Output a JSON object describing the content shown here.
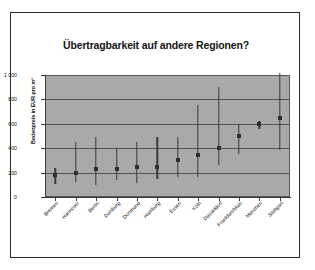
{
  "slide": {
    "title": "Übertragbarkeit auf andere Regionen?"
  },
  "chart_data": {
    "type": "scatter",
    "title": "Übertragbarkeit auf andere Regionen?",
    "xlabel": "",
    "ylabel": "Bodenpreis in EUR pro m²",
    "ylim": [
      0,
      1000
    ],
    "ytick_labels": [
      "1 000",
      "800",
      "600",
      "400",
      "200",
      "0"
    ],
    "ytick_values": [
      1000,
      800,
      600,
      400,
      200,
      0
    ],
    "grid": true,
    "gridline_values": [
      800,
      600,
      400,
      200
    ],
    "legend": "none",
    "plot_background": "#a9a9a9",
    "marker_color": "#2e2e2e",
    "categories": [
      "Bremen",
      "Hannover",
      "Berlin",
      "Duisburg",
      "Dortmund",
      "Hamburg",
      "Essen",
      "Köln",
      "Düsseldorf",
      "Frankfurt/Main",
      "München",
      "Stuttgart"
    ],
    "series": [
      {
        "name": "Bodenpreis (Median)",
        "values": [
          180,
          200,
          230,
          230,
          250,
          250,
          305,
          345,
          400,
          500,
          600,
          650
        ]
      },
      {
        "name": "Untergrenze",
        "values": [
          110,
          125,
          100,
          135,
          115,
          150,
          160,
          160,
          265,
          350,
          555,
          390
        ]
      },
      {
        "name": "Obergrenze",
        "values": [
          240,
          450,
          495,
          400,
          450,
          495,
          495,
          755,
          900,
          595,
          625,
          1020
        ]
      }
    ],
    "points": [
      {
        "category": "Bremen",
        "low": 110,
        "mid": 180,
        "high": 240
      },
      {
        "category": "Hannover",
        "low": 125,
        "mid": 200,
        "high": 450
      },
      {
        "category": "Berlin",
        "low": 100,
        "mid": 230,
        "high": 495
      },
      {
        "category": "Duisburg",
        "low": 135,
        "mid": 230,
        "high": 400
      },
      {
        "category": "Dortmund",
        "low": 115,
        "mid": 250,
        "high": 450
      },
      {
        "category": "Hamburg",
        "low": 150,
        "mid": 250,
        "high": 495
      },
      {
        "category": "Essen",
        "low": 160,
        "mid": 305,
        "high": 495
      },
      {
        "category": "Köln",
        "low": 160,
        "mid": 345,
        "high": 755
      },
      {
        "category": "Düsseldorf",
        "low": 265,
        "mid": 400,
        "high": 900
      },
      {
        "category": "Frankfurt/Main",
        "low": 350,
        "mid": 500,
        "high": 595
      },
      {
        "category": "München",
        "low": 555,
        "mid": 600,
        "high": 625
      },
      {
        "category": "Stuttgart",
        "low": 390,
        "mid": 650,
        "high": 1020
      }
    ]
  }
}
